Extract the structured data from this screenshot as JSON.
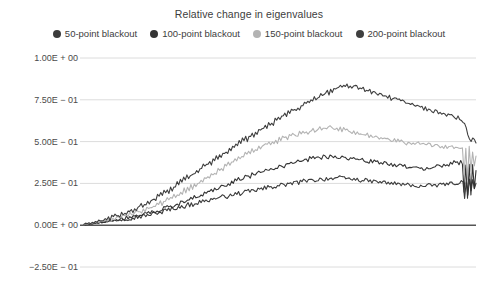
{
  "chart_data": {
    "type": "line",
    "title": "Relative change in eigenvalues",
    "xlabel": "",
    "ylabel": "",
    "grid": true,
    "legend_position": "top",
    "ylim": [
      -0.25,
      1.0
    ],
    "xlim": [
      0,
      1
    ],
    "ytick_labels": [
      "1.00E + 00",
      "7.50E − 01",
      "5.00E − 01",
      "2.50E − 01",
      "0.00E + 00",
      "−2.50E − 01"
    ],
    "ytick_values": [
      1.0,
      0.75,
      0.5,
      0.25,
      0.0,
      -0.25
    ],
    "xtick_labels": [],
    "zero_line": 0.0,
    "series": [
      {
        "name": "50-point blackout",
        "color": "#3b3b3b",
        "values": [
          0.005,
          0.004,
          0.008,
          0.006,
          0.01,
          0.009,
          0.013,
          0.011,
          0.015,
          0.014,
          0.018,
          0.016,
          0.02,
          0.019,
          0.023,
          0.021,
          0.026,
          0.024,
          0.029,
          0.027,
          0.032,
          0.03,
          0.035,
          0.033,
          0.038,
          0.036,
          0.041,
          0.039,
          0.044,
          0.042,
          0.047,
          0.045,
          0.05,
          0.048,
          0.053,
          0.051,
          0.056,
          0.054,
          0.06,
          0.058,
          0.063,
          0.061,
          0.066,
          0.07,
          0.068,
          0.075,
          0.072,
          0.08,
          0.076,
          0.085,
          0.09,
          0.086,
          0.095,
          0.091,
          0.1,
          0.096,
          0.104,
          0.1,
          0.108,
          0.112,
          0.107,
          0.116,
          0.111,
          0.12,
          0.124,
          0.119,
          0.128,
          0.123,
          0.132,
          0.136,
          0.131,
          0.14,
          0.135,
          0.144,
          0.148,
          0.143,
          0.152,
          0.147,
          0.156,
          0.16,
          0.155,
          0.164,
          0.159,
          0.168,
          0.163,
          0.172,
          0.167,
          0.176,
          0.171,
          0.18,
          0.175,
          0.184,
          0.179,
          0.188,
          0.183,
          0.192,
          0.187,
          0.196,
          0.191,
          0.2,
          0.195,
          0.204,
          0.199,
          0.208,
          0.203,
          0.212,
          0.207,
          0.216,
          0.211,
          0.22,
          0.215,
          0.224,
          0.219,
          0.228,
          0.223,
          0.232,
          0.227,
          0.236,
          0.231,
          0.24,
          0.235,
          0.244,
          0.239,
          0.246,
          0.242,
          0.25,
          0.245,
          0.253,
          0.248,
          0.256,
          0.251,
          0.259,
          0.254,
          0.262,
          0.257,
          0.265,
          0.26,
          0.268,
          0.263,
          0.27,
          0.265,
          0.272,
          0.268,
          0.274,
          0.27,
          0.276,
          0.272,
          0.278,
          0.274,
          0.28,
          0.276,
          0.282,
          0.278,
          0.284,
          0.28,
          0.286,
          0.282,
          0.285,
          0.281,
          0.283,
          0.279,
          0.281,
          0.277,
          0.279,
          0.275,
          0.277,
          0.273,
          0.275,
          0.271,
          0.273,
          0.269,
          0.27,
          0.266,
          0.268,
          0.264,
          0.266,
          0.262,
          0.264,
          0.26,
          0.262,
          0.258,
          0.26,
          0.256,
          0.258,
          0.254,
          0.256,
          0.252,
          0.254,
          0.25,
          0.252,
          0.248,
          0.25,
          0.246,
          0.248,
          0.244,
          0.246,
          0.242,
          0.244,
          0.24,
          0.242,
          0.238,
          0.24,
          0.236,
          0.238,
          0.234,
          0.236,
          0.232,
          0.234,
          0.23,
          0.232,
          0.236,
          0.232,
          0.238,
          0.234,
          0.24,
          0.236,
          0.242,
          0.238,
          0.244,
          0.24,
          0.246,
          0.242,
          0.248,
          0.244,
          0.25,
          0.246,
          0.252,
          0.248,
          0.254,
          0.25,
          0.256,
          0.252,
          0.258,
          0.254,
          0.16,
          0.26,
          0.19,
          0.27,
          0.2,
          0.265,
          0.21,
          0.255
        ]
      },
      {
        "name": "100-point blackout",
        "color": "#343434",
        "values": [
          0.005,
          0.006,
          0.004,
          0.009,
          0.007,
          0.012,
          0.01,
          0.015,
          0.013,
          0.018,
          0.016,
          0.021,
          0.019,
          0.025,
          0.022,
          0.028,
          0.026,
          0.032,
          0.029,
          0.036,
          0.033,
          0.04,
          0.037,
          0.044,
          0.041,
          0.048,
          0.045,
          0.052,
          0.049,
          0.057,
          0.053,
          0.061,
          0.058,
          0.066,
          0.062,
          0.07,
          0.067,
          0.075,
          0.071,
          0.08,
          0.076,
          0.085,
          0.081,
          0.09,
          0.086,
          0.096,
          0.091,
          0.102,
          0.097,
          0.108,
          0.103,
          0.115,
          0.11,
          0.122,
          0.117,
          0.13,
          0.124,
          0.138,
          0.132,
          0.146,
          0.14,
          0.154,
          0.148,
          0.162,
          0.156,
          0.17,
          0.164,
          0.178,
          0.172,
          0.186,
          0.18,
          0.194,
          0.188,
          0.202,
          0.196,
          0.21,
          0.204,
          0.218,
          0.212,
          0.226,
          0.22,
          0.234,
          0.228,
          0.242,
          0.236,
          0.25,
          0.244,
          0.258,
          0.252,
          0.266,
          0.26,
          0.274,
          0.268,
          0.282,
          0.276,
          0.29,
          0.284,
          0.297,
          0.291,
          0.304,
          0.298,
          0.311,
          0.305,
          0.318,
          0.312,
          0.324,
          0.318,
          0.33,
          0.324,
          0.336,
          0.33,
          0.342,
          0.336,
          0.348,
          0.342,
          0.354,
          0.348,
          0.36,
          0.354,
          0.366,
          0.36,
          0.372,
          0.366,
          0.378,
          0.372,
          0.383,
          0.378,
          0.388,
          0.383,
          0.392,
          0.387,
          0.396,
          0.391,
          0.4,
          0.395,
          0.403,
          0.398,
          0.406,
          0.401,
          0.408,
          0.403,
          0.41,
          0.405,
          0.412,
          0.407,
          0.413,
          0.408,
          0.414,
          0.409,
          0.412,
          0.407,
          0.41,
          0.405,
          0.408,
          0.403,
          0.405,
          0.4,
          0.402,
          0.397,
          0.399,
          0.394,
          0.396,
          0.391,
          0.393,
          0.388,
          0.39,
          0.385,
          0.387,
          0.382,
          0.384,
          0.379,
          0.381,
          0.376,
          0.378,
          0.373,
          0.375,
          0.37,
          0.372,
          0.367,
          0.369,
          0.364,
          0.366,
          0.361,
          0.363,
          0.358,
          0.36,
          0.355,
          0.357,
          0.352,
          0.354,
          0.349,
          0.351,
          0.346,
          0.348,
          0.343,
          0.345,
          0.34,
          0.342,
          0.337,
          0.339,
          0.334,
          0.336,
          0.34,
          0.336,
          0.345,
          0.34,
          0.35,
          0.345,
          0.355,
          0.35,
          0.36,
          0.355,
          0.364,
          0.359,
          0.368,
          0.363,
          0.372,
          0.367,
          0.376,
          0.37,
          0.378,
          0.372,
          0.38,
          0.374,
          0.2,
          0.35,
          0.17,
          0.36,
          0.19,
          0.355,
          0.21,
          0.33
        ]
      },
      {
        "name": "150-point blackout",
        "color": "#b3b3b3",
        "values": [
          0.004,
          0.007,
          0.005,
          0.011,
          0.008,
          0.014,
          0.012,
          0.018,
          0.015,
          0.022,
          0.019,
          0.026,
          0.023,
          0.03,
          0.027,
          0.035,
          0.031,
          0.04,
          0.036,
          0.045,
          0.041,
          0.05,
          0.046,
          0.056,
          0.051,
          0.062,
          0.057,
          0.068,
          0.063,
          0.074,
          0.069,
          0.08,
          0.075,
          0.087,
          0.081,
          0.094,
          0.088,
          0.101,
          0.095,
          0.109,
          0.102,
          0.117,
          0.11,
          0.126,
          0.118,
          0.135,
          0.127,
          0.145,
          0.136,
          0.155,
          0.146,
          0.166,
          0.157,
          0.177,
          0.168,
          0.188,
          0.179,
          0.2,
          0.19,
          0.212,
          0.202,
          0.224,
          0.214,
          0.236,
          0.226,
          0.248,
          0.238,
          0.26,
          0.25,
          0.272,
          0.262,
          0.284,
          0.274,
          0.296,
          0.286,
          0.308,
          0.298,
          0.32,
          0.31,
          0.332,
          0.322,
          0.344,
          0.334,
          0.356,
          0.346,
          0.368,
          0.358,
          0.38,
          0.37,
          0.392,
          0.382,
          0.404,
          0.394,
          0.416,
          0.406,
          0.427,
          0.418,
          0.438,
          0.429,
          0.448,
          0.44,
          0.458,
          0.45,
          0.468,
          0.459,
          0.476,
          0.468,
          0.484,
          0.476,
          0.492,
          0.484,
          0.5,
          0.492,
          0.508,
          0.5,
          0.515,
          0.507,
          0.521,
          0.513,
          0.527,
          0.519,
          0.533,
          0.525,
          0.539,
          0.531,
          0.545,
          0.537,
          0.551,
          0.543,
          0.557,
          0.549,
          0.563,
          0.555,
          0.568,
          0.56,
          0.572,
          0.564,
          0.576,
          0.568,
          0.58,
          0.572,
          0.583,
          0.575,
          0.586,
          0.578,
          0.588,
          0.58,
          0.585,
          0.577,
          0.582,
          0.574,
          0.578,
          0.57,
          0.574,
          0.566,
          0.57,
          0.562,
          0.565,
          0.557,
          0.56,
          0.552,
          0.555,
          0.547,
          0.55,
          0.542,
          0.545,
          0.537,
          0.54,
          0.532,
          0.535,
          0.527,
          0.53,
          0.522,
          0.525,
          0.517,
          0.52,
          0.512,
          0.516,
          0.508,
          0.513,
          0.505,
          0.51,
          0.502,
          0.508,
          0.5,
          0.505,
          0.497,
          0.502,
          0.494,
          0.5,
          0.492,
          0.497,
          0.489,
          0.494,
          0.487,
          0.491,
          0.484,
          0.489,
          0.482,
          0.487,
          0.48,
          0.485,
          0.478,
          0.483,
          0.476,
          0.481,
          0.474,
          0.479,
          0.472,
          0.478,
          0.47,
          0.476,
          0.468,
          0.474,
          0.466,
          0.472,
          0.464,
          0.47,
          0.462,
          0.468,
          0.46,
          0.466,
          0.458,
          0.464,
          0.3,
          0.45,
          0.27,
          0.46,
          0.33,
          0.44,
          0.35,
          0.42
        ]
      },
      {
        "name": "200-point blackout",
        "color": "#3f3f3f",
        "values": [
          0.006,
          0.009,
          0.006,
          0.013,
          0.01,
          0.017,
          0.014,
          0.022,
          0.018,
          0.027,
          0.022,
          0.032,
          0.027,
          0.038,
          0.032,
          0.044,
          0.038,
          0.05,
          0.044,
          0.056,
          0.05,
          0.063,
          0.057,
          0.07,
          0.063,
          0.078,
          0.07,
          0.086,
          0.078,
          0.094,
          0.086,
          0.103,
          0.094,
          0.112,
          0.103,
          0.121,
          0.112,
          0.131,
          0.121,
          0.141,
          0.131,
          0.152,
          0.142,
          0.163,
          0.153,
          0.175,
          0.164,
          0.187,
          0.176,
          0.199,
          0.188,
          0.212,
          0.2,
          0.225,
          0.213,
          0.238,
          0.226,
          0.251,
          0.239,
          0.264,
          0.252,
          0.277,
          0.265,
          0.29,
          0.278,
          0.303,
          0.291,
          0.316,
          0.304,
          0.329,
          0.317,
          0.342,
          0.33,
          0.355,
          0.343,
          0.368,
          0.356,
          0.381,
          0.369,
          0.394,
          0.382,
          0.407,
          0.395,
          0.42,
          0.408,
          0.433,
          0.421,
          0.446,
          0.434,
          0.459,
          0.447,
          0.472,
          0.46,
          0.485,
          0.473,
          0.498,
          0.486,
          0.51,
          0.499,
          0.522,
          0.511,
          0.534,
          0.523,
          0.546,
          0.535,
          0.558,
          0.547,
          0.57,
          0.559,
          0.582,
          0.571,
          0.594,
          0.583,
          0.606,
          0.595,
          0.618,
          0.607,
          0.63,
          0.619,
          0.642,
          0.631,
          0.654,
          0.643,
          0.666,
          0.655,
          0.678,
          0.667,
          0.69,
          0.679,
          0.7,
          0.69,
          0.71,
          0.7,
          0.72,
          0.71,
          0.73,
          0.72,
          0.74,
          0.73,
          0.75,
          0.74,
          0.76,
          0.75,
          0.77,
          0.76,
          0.78,
          0.77,
          0.79,
          0.78,
          0.8,
          0.79,
          0.81,
          0.8,
          0.82,
          0.81,
          0.825,
          0.815,
          0.83,
          0.82,
          0.835,
          0.825,
          0.838,
          0.828,
          0.84,
          0.83,
          0.835,
          0.825,
          0.828,
          0.818,
          0.822,
          0.812,
          0.816,
          0.806,
          0.81,
          0.8,
          0.804,
          0.794,
          0.798,
          0.788,
          0.792,
          0.782,
          0.786,
          0.776,
          0.78,
          0.77,
          0.774,
          0.764,
          0.768,
          0.758,
          0.762,
          0.752,
          0.756,
          0.746,
          0.75,
          0.74,
          0.744,
          0.734,
          0.738,
          0.728,
          0.732,
          0.722,
          0.726,
          0.716,
          0.72,
          0.71,
          0.714,
          0.704,
          0.708,
          0.698,
          0.702,
          0.692,
          0.696,
          0.686,
          0.69,
          0.68,
          0.684,
          0.674,
          0.678,
          0.668,
          0.672,
          0.662,
          0.666,
          0.656,
          0.66,
          0.65,
          0.654,
          0.644,
          0.648,
          0.638,
          0.642,
          0.632,
          0.636,
          0.626,
          0.6,
          0.58,
          0.55,
          0.52,
          0.5,
          0.53,
          0.51,
          0.5
        ]
      }
    ]
  },
  "colors": {
    "background": "#ffffff",
    "gridline": "#dcdcdc",
    "zero_axis": "#555555",
    "text": "#3d3d3d"
  }
}
